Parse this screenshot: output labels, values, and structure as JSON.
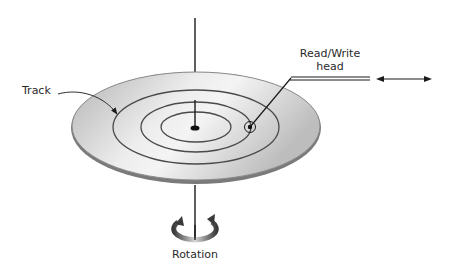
{
  "diagram": {
    "labels": {
      "track": "Track",
      "head_line1": "Read/Write",
      "head_line2": "head",
      "rotation": "Rotation"
    },
    "icons": {
      "rotation": "rotation-arrows-icon",
      "head_motion": "double-headed-arrow-icon"
    },
    "colors": {
      "disk_fill_light": "#f2f2f2",
      "disk_fill_dark": "#a9a9a9",
      "outline": "#6e6e6e",
      "ink": "#1a1a1a",
      "text": "#2a2a2a"
    },
    "tracks_count": 3
  }
}
